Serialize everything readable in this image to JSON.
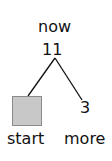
{
  "diagram": {
    "root": {
      "label": "now",
      "value": "11"
    },
    "children": [
      {
        "label": "start",
        "value": "",
        "shape": "filled-square",
        "fill": "#c8c8c8"
      },
      {
        "label": "more",
        "value": "3"
      }
    ]
  }
}
